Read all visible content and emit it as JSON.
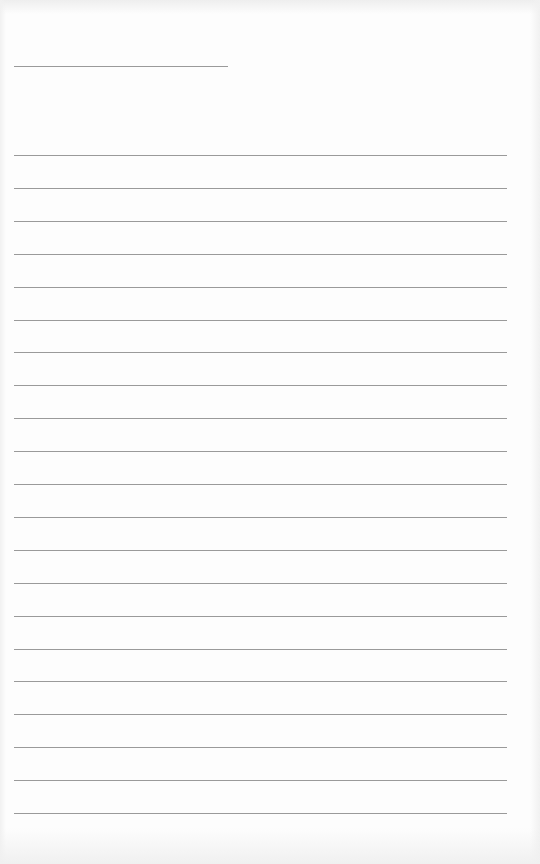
{
  "page": {
    "type": "lined-writing-paper",
    "background_color": "#fdfdfd",
    "line_color": "#9a9a9a",
    "header_line": {
      "x": 14,
      "y": 66,
      "width": 214,
      "text": ""
    },
    "ruled_lines": {
      "count": 21,
      "x": 14,
      "width": 493,
      "first_y": 155,
      "spacing": 32.9,
      "texts": [
        "",
        "",
        "",
        "",
        "",
        "",
        "",
        "",
        "",
        "",
        "",
        "",
        "",
        "",
        "",
        "",
        "",
        "",
        "",
        "",
        ""
      ]
    }
  }
}
